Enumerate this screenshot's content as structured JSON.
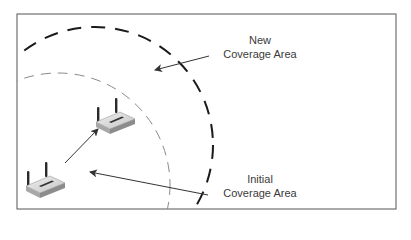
{
  "diagram": {
    "type": "wireless-coverage-diagram",
    "frame": {
      "x": 17,
      "y": 14,
      "width": 379,
      "height": 195,
      "stroke": "#555555"
    },
    "coverage_areas": [
      {
        "id": "new",
        "label_line1": "New",
        "label_line2": "Coverage Area",
        "circle": {
          "cx": 95,
          "cy": 145,
          "r": 118
        },
        "stroke": "#1a1a1a",
        "stroke_width": 2,
        "dash": "14 10"
      },
      {
        "id": "initial",
        "label_line1": "Initial",
        "label_line2": "Coverage Area",
        "circle": {
          "cx": 58,
          "cy": 185,
          "r": 112
        },
        "stroke": "#888888",
        "stroke_width": 1,
        "dash": "10 7"
      }
    ],
    "devices": [
      {
        "id": "router-initial",
        "icon": "wireless-router-icon",
        "x": 26,
        "y": 162
      },
      {
        "id": "router-new",
        "icon": "wireless-router-icon",
        "x": 96,
        "y": 98
      }
    ],
    "arrows": [
      {
        "id": "new-coverage-pointer",
        "from": [
          209,
          56
        ],
        "to": [
          155,
          70
        ]
      },
      {
        "id": "router-move",
        "from": [
          65,
          163
        ],
        "to": [
          98,
          129
        ]
      },
      {
        "id": "initial-coverage-pointer",
        "from": [
          208,
          195
        ],
        "to": [
          90,
          172
        ]
      }
    ],
    "colors": {
      "background": "#ffffff",
      "text": "#3a3a3a",
      "arrow": "#333333",
      "router_body": "#d8d8d8",
      "router_shadow": "#9a9a9a",
      "antenna": "#2a2a2a"
    }
  },
  "labels": {
    "new": {
      "line1": "New",
      "line2": "Coverage Area"
    },
    "initial": {
      "line1": "Initial",
      "line2": "Coverage Area"
    }
  }
}
